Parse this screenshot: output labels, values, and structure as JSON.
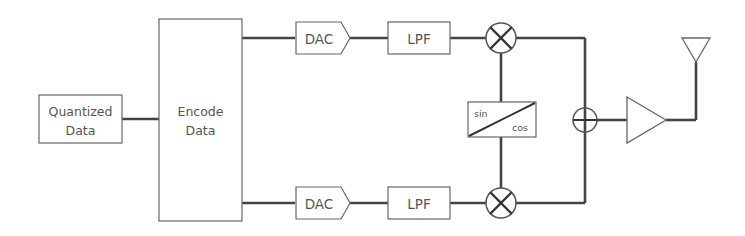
{
  "diagram": {
    "title": "",
    "blocks": {
      "quantized": {
        "line1": "Quantized",
        "line2": "Data"
      },
      "encode": {
        "line1": "Encode",
        "line2": "Data"
      },
      "dac_top": {
        "label": "DAC"
      },
      "lpf_top": {
        "label": "LPF"
      },
      "dac_bottom": {
        "label": "DAC"
      },
      "lpf_bottom": {
        "label": "LPF"
      },
      "oscillator": {
        "sin": "sin",
        "cos": "cos"
      }
    },
    "components": [
      "mixer-top",
      "mixer-bottom",
      "summer",
      "amplifier",
      "antenna"
    ],
    "colors": {
      "line": "#444444",
      "box": "#666666",
      "text": "#555555"
    }
  }
}
